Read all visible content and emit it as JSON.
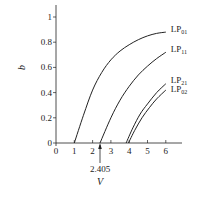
{
  "chart_data": {
    "type": "line",
    "title": "",
    "xlabel": "V",
    "ylabel": "b",
    "xlim": [
      0,
      6.8
    ],
    "ylim": [
      0,
      1.08
    ],
    "x_ticks": [
      "0",
      "1",
      "2",
      "3",
      "4",
      "5",
      "6"
    ],
    "y_ticks": [
      "0",
      "0.2",
      "0.4",
      "0.6",
      "0.8",
      "1"
    ],
    "annotation": {
      "text": "2.405",
      "x": 2.405,
      "y": 0,
      "arrow": "up"
    },
    "grid": false,
    "series": [
      {
        "name": "LP01",
        "label_main": "LP",
        "label_sub": "01",
        "points": [
          [
            1.0,
            0.0
          ],
          [
            1.5,
            0.22
          ],
          [
            2.0,
            0.42
          ],
          [
            2.5,
            0.56
          ],
          [
            3.0,
            0.66
          ],
          [
            3.5,
            0.73
          ],
          [
            4.0,
            0.78
          ],
          [
            4.5,
            0.82
          ],
          [
            5.0,
            0.85
          ],
          [
            5.5,
            0.87
          ],
          [
            6.0,
            0.88
          ]
        ]
      },
      {
        "name": "LP11",
        "label_main": "LP",
        "label_sub": "11",
        "points": [
          [
            2.405,
            0.0
          ],
          [
            3.0,
            0.2
          ],
          [
            3.5,
            0.34
          ],
          [
            4.0,
            0.45
          ],
          [
            4.5,
            0.54
          ],
          [
            5.0,
            0.61
          ],
          [
            5.5,
            0.67
          ],
          [
            6.0,
            0.72
          ]
        ]
      },
      {
        "name": "LP21",
        "label_main": "LP",
        "label_sub": "21",
        "points": [
          [
            3.832,
            0.0
          ],
          [
            4.2,
            0.12
          ],
          [
            4.6,
            0.23
          ],
          [
            5.0,
            0.31
          ],
          [
            5.5,
            0.4
          ],
          [
            6.0,
            0.47
          ]
        ]
      },
      {
        "name": "LP02",
        "label_main": "LP",
        "label_sub": "02",
        "points": [
          [
            3.96,
            0.0
          ],
          [
            4.3,
            0.1
          ],
          [
            4.7,
            0.2
          ],
          [
            5.1,
            0.28
          ],
          [
            5.5,
            0.35
          ],
          [
            6.0,
            0.42
          ]
        ]
      }
    ]
  }
}
